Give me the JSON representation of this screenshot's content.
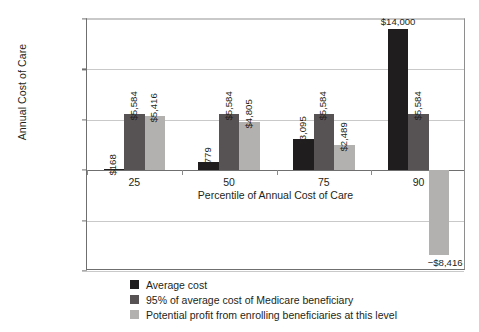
{
  "chart_data": {
    "type": "bar",
    "title": "",
    "subtitle": "",
    "xlabel": "Percentile of Annual Cost of Care",
    "ylabel": "Annual Cost of Care",
    "categories": [
      "25",
      "50",
      "75",
      "90"
    ],
    "series": [
      {
        "name": "Average cost",
        "color": "#1f1d1e",
        "values": [
          168,
          779,
          3095,
          14000
        ],
        "labels": [
          "$168",
          "$779",
          "$3,095",
          "$14,000"
        ]
      },
      {
        "name": "95% of average cost of Medicare beneficiary",
        "color": "#575354",
        "values": [
          5584,
          5584,
          5584,
          5584
        ],
        "labels": [
          "$5,584",
          "$5,584",
          "$5,584",
          "$5,584"
        ]
      },
      {
        "name": "Potential profit from enrolling beneficiaries at this level",
        "color": "#b3b1b0",
        "values": [
          5416,
          4805,
          2489,
          -8416
        ],
        "labels": [
          "$5,416",
          "$4,805",
          "$2,489",
          "−$8,416"
        ]
      }
    ],
    "ylim": [
      -10000,
      15000
    ],
    "yticks": [
      15000,
      10000,
      5000,
      0,
      -5000,
      -10000
    ],
    "ytick_labels": [
      "$15,000",
      "$10,000",
      "$5,000",
      "$0",
      "−$5,000",
      "−$10,000"
    ],
    "grid": true,
    "legend_position": "bottom"
  },
  "legend": {
    "items": [
      {
        "label": "Average cost",
        "color": "#1f1d1e"
      },
      {
        "label": "95% of average cost of Medicare beneficiary",
        "color": "#575354"
      },
      {
        "label": "Potential profit from enrolling beneficiaries at this level",
        "color": "#b3b1b0"
      }
    ]
  }
}
